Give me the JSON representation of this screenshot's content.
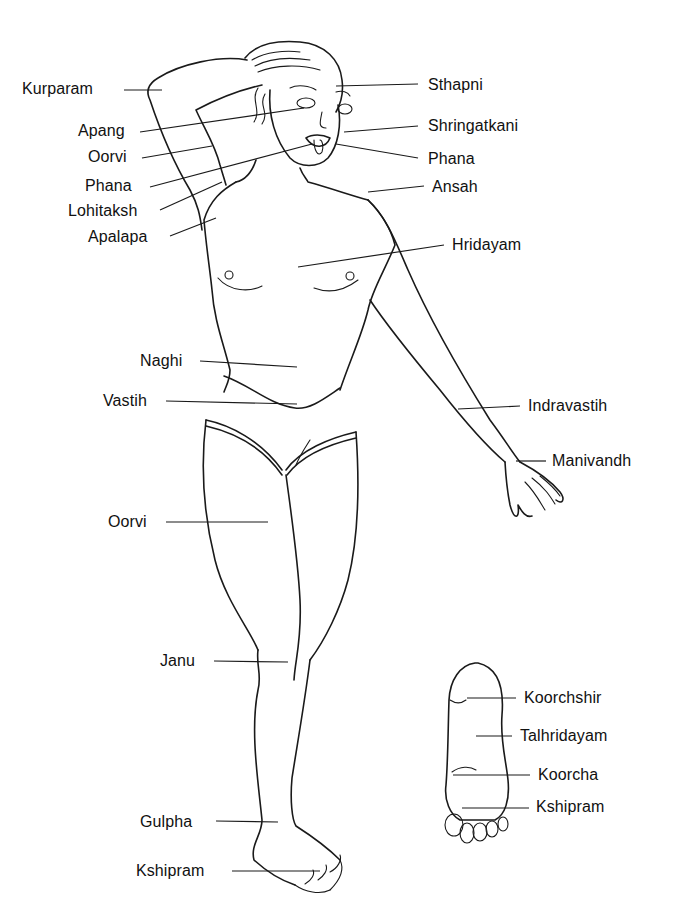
{
  "diagram": {
    "body_labels": [
      {
        "id": "kurparam",
        "text": "Kurparam",
        "x": 22,
        "y": 80
      },
      {
        "id": "apang",
        "text": "Apang",
        "x": 78,
        "y": 122
      },
      {
        "id": "oorvi-upper",
        "text": "Oorvi",
        "x": 88,
        "y": 148
      },
      {
        "id": "phana-left",
        "text": "Phana",
        "x": 85,
        "y": 177
      },
      {
        "id": "lohitaksh",
        "text": "Lohitaksh",
        "x": 68,
        "y": 202
      },
      {
        "id": "apalapa",
        "text": "Apalapa",
        "x": 88,
        "y": 228
      },
      {
        "id": "sthapni",
        "text": "Sthapni",
        "x": 428,
        "y": 76
      },
      {
        "id": "shringatkani",
        "text": "Shringatkani",
        "x": 428,
        "y": 117
      },
      {
        "id": "phana-right",
        "text": "Phana",
        "x": 428,
        "y": 150
      },
      {
        "id": "ansah",
        "text": "Ansah",
        "x": 432,
        "y": 178
      },
      {
        "id": "hridayam",
        "text": "Hridayam",
        "x": 452,
        "y": 236
      },
      {
        "id": "naghi",
        "text": "Naghi",
        "x": 140,
        "y": 350
      },
      {
        "id": "vastih",
        "text": "Vastih",
        "x": 103,
        "y": 392
      },
      {
        "id": "indravastih",
        "text": "Indravastih",
        "x": 528,
        "y": 397
      },
      {
        "id": "manivandh",
        "text": "Manivandh",
        "x": 552,
        "y": 452
      },
      {
        "id": "oorvi-thigh",
        "text": "Oorvi",
        "x": 108,
        "y": 513
      },
      {
        "id": "janu",
        "text": "Janu",
        "x": 160,
        "y": 653
      },
      {
        "id": "gulpha",
        "text": "Gulpha",
        "x": 140,
        "y": 813
      },
      {
        "id": "kshipram-foot",
        "text": "Kshipram",
        "x": 136,
        "y": 862
      }
    ],
    "sole_labels": [
      {
        "id": "koorchshir",
        "text": "Koorchshir",
        "x": 524,
        "y": 692
      },
      {
        "id": "talhridayam",
        "text": "Talhridayam",
        "x": 520,
        "y": 730
      },
      {
        "id": "koorcha",
        "text": "Koorcha",
        "x": 538,
        "y": 767
      },
      {
        "id": "kshipram-sole",
        "text": "Kshipram",
        "x": 536,
        "y": 798
      }
    ]
  }
}
